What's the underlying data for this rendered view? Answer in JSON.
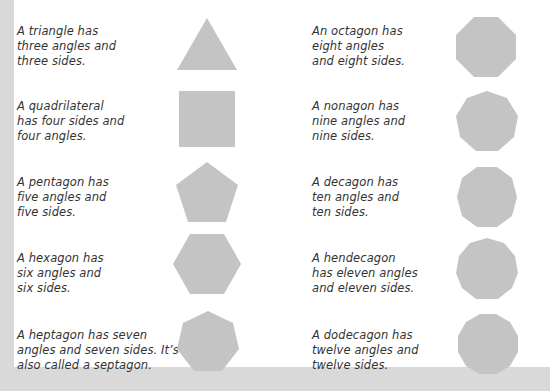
{
  "page": {
    "background_color": "#d9d9d9",
    "card_color": "#ffffff",
    "shape_color": "#c4c4c4",
    "text_color": "#333333"
  },
  "polygons": [
    {
      "name": "triangle",
      "sides": 3,
      "text": "A triangle has\nthree angles and\nthree sides."
    },
    {
      "name": "quadrilateral",
      "sides": 4,
      "text": "A quadrilateral\nhas four sides and\nfour angles."
    },
    {
      "name": "pentagon",
      "sides": 5,
      "text": "A pentagon has\nfive angles and\nfive sides."
    },
    {
      "name": "hexagon",
      "sides": 6,
      "text": "A hexagon has\nsix angles and\nsix sides."
    },
    {
      "name": "heptagon",
      "sides": 7,
      "text": "A heptagon has seven\nangles and seven sides. It’s\nalso called a septagon."
    },
    {
      "name": "octagon",
      "sides": 8,
      "text": "An octagon has\neight angles\nand eight sides."
    },
    {
      "name": "nonagon",
      "sides": 9,
      "text": "A nonagon has\nnine angles and\nnine sides."
    },
    {
      "name": "decagon",
      "sides": 10,
      "text": "A decagon has\nten angles and\nten sides."
    },
    {
      "name": "hendecagon",
      "sides": 11,
      "text": "A hendecagon\nhas eleven angles\nand eleven sides."
    },
    {
      "name": "dodecagon",
      "sides": 12,
      "text": "A dodecagon has\ntwelve angles and\ntwelve sides."
    }
  ]
}
